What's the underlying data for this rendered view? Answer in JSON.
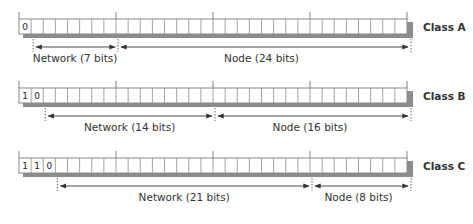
{
  "diagram": {
    "total_bits": 32,
    "classes": [
      {
        "name": "Class A",
        "prefix_bits": [
          "0"
        ],
        "network_label": "Network (7 bits)",
        "node_label": "Node (24 bits)",
        "network_bits": 7,
        "node_bits": 24
      },
      {
        "name": "Class B",
        "prefix_bits": [
          "1",
          "0"
        ],
        "network_label": "Network (14 bits)",
        "node_label": "Node (16 bits)",
        "network_bits": 14,
        "node_bits": 16
      },
      {
        "name": "Class C",
        "prefix_bits": [
          "1",
          "1",
          "0"
        ],
        "network_label": "Network (21 bits)",
        "node_label": "Node (8 bits)",
        "network_bits": 21,
        "node_bits": 8
      }
    ]
  },
  "colors": {
    "cell_border": "#8a8a8a",
    "shadow": "#8c8c8c",
    "arrow": "#333333",
    "text": "#333333"
  }
}
